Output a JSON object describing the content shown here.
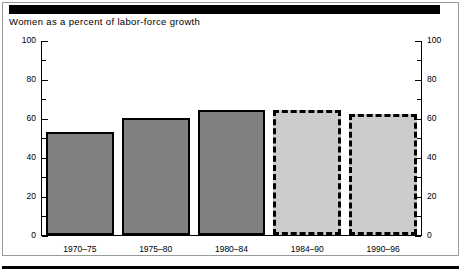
{
  "figure": {
    "title": "Women as a percent of labor-force growth"
  },
  "chart_data": {
    "type": "bar",
    "title": "Women as a percent of labor-force growth",
    "xlabel": "",
    "ylabel": "",
    "categories": [
      "1970–75",
      "1975–80",
      "1980–84",
      "1984–90",
      "1990–96"
    ],
    "values": [
      53,
      60,
      64,
      64,
      62
    ],
    "series": [
      {
        "name": "Women as a percent of labor-force growth",
        "values": [
          53,
          60,
          64,
          64,
          62
        ],
        "styles": [
          "actual",
          "actual",
          "actual",
          "projected",
          "projected"
        ]
      }
    ],
    "ylim": [
      0,
      100
    ],
    "y_ticks_major": [
      0,
      20,
      40,
      60,
      80,
      100
    ],
    "y_ticks_minor": [
      10,
      30,
      50,
      70,
      90
    ],
    "y_tick_labels_left": [
      "0",
      "20",
      "40",
      "60",
      "80",
      "100"
    ],
    "y_tick_labels_right": [
      "0",
      "20",
      "40",
      "60",
      "80",
      "100"
    ],
    "grid": false,
    "legend": null,
    "colors": {
      "bar_actual_fill": "#808080",
      "bar_projected_fill": "#cccccc",
      "bar_border": "#000000",
      "axis": "#000000",
      "background": "#ffffff",
      "rule": "#000000"
    }
  }
}
